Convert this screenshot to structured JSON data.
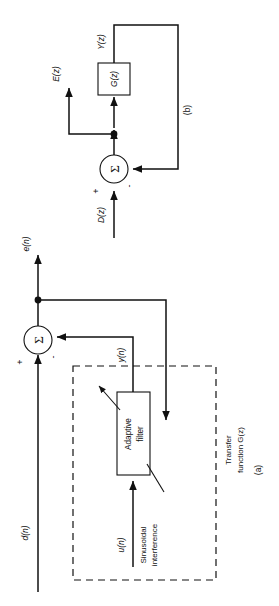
{
  "figure": {
    "panels": [
      {
        "id": "a",
        "caption": "(a)",
        "signals": {
          "primary_input": "d(n)",
          "reference_input": "u(n)",
          "filter_output": "y(n)",
          "error_output": "e(n)"
        },
        "blocks": {
          "adaptive_filter_line1": "Adaptive",
          "adaptive_filter_line2": "filter"
        },
        "annotations": {
          "reference_source_line1": "Sinusoidal",
          "reference_source_line2": "interference",
          "enclosure_line1": "Transfer",
          "enclosure_line2": "function G(z)"
        },
        "summing_junction": {
          "symbol": "Σ",
          "plus_sign": "+",
          "minus_sign": "-"
        }
      },
      {
        "id": "b",
        "caption": "(b)",
        "signals": {
          "input": "D(z)",
          "error_output": "E(z)",
          "feedback_output": "Y(z)"
        },
        "blocks": {
          "transfer_function": "G(z)"
        },
        "summing_junction": {
          "symbol": "Σ",
          "plus_sign": "+",
          "minus_sign": "-"
        }
      }
    ],
    "colors": {
      "ink": "#111111",
      "background": "#ffffff"
    }
  }
}
